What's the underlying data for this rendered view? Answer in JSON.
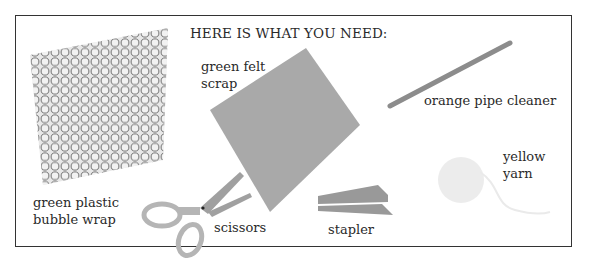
{
  "title": "HERE IS WHAT YOU NEED:",
  "items": [
    {
      "id": "bubble-wrap",
      "label": "green plastic\nbubble wrap",
      "icon": "bubble-wrap-icon"
    },
    {
      "id": "felt",
      "label": "green felt\nscrap",
      "icon": "felt-scrap-icon"
    },
    {
      "id": "pipe-cleaner",
      "label": "orange pipe cleaner",
      "icon": "pipe-cleaner-icon"
    },
    {
      "id": "yarn",
      "label": "yellow\nyarn",
      "icon": "yarn-icon"
    },
    {
      "id": "scissors",
      "label": "scissors",
      "icon": "scissors-icon"
    },
    {
      "id": "stapler",
      "label": "stapler",
      "icon": "stapler-icon"
    }
  ],
  "colors": {
    "border": "#333333",
    "item_gray": "#a8a8a8",
    "dark_gray": "#8a8a8a",
    "yarn": "#ececec"
  }
}
